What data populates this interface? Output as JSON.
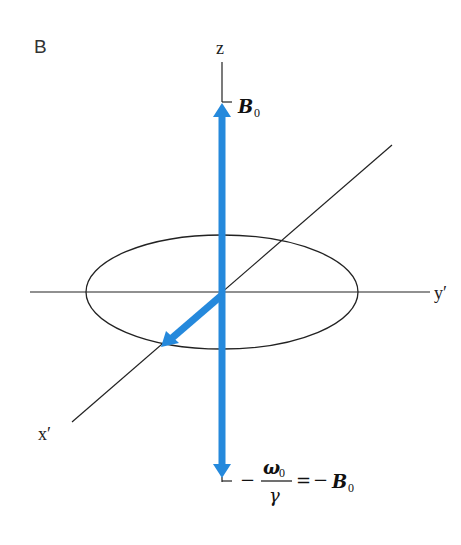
{
  "figure": {
    "panel_label": "B",
    "axes": {
      "z": "z",
      "y": "y′",
      "x": "x′"
    },
    "top_vector_label": {
      "symbol": "B",
      "subscript": "0"
    },
    "bottom_vector_label": {
      "minus1": "−",
      "numerator": "ω",
      "numerator_subscript": "0",
      "denominator": "γ",
      "equals": "=",
      "minus2": "−",
      "symbol": "B",
      "subscript": "0"
    },
    "colors": {
      "vector": "#2589dc",
      "axis": "#222222"
    }
  }
}
